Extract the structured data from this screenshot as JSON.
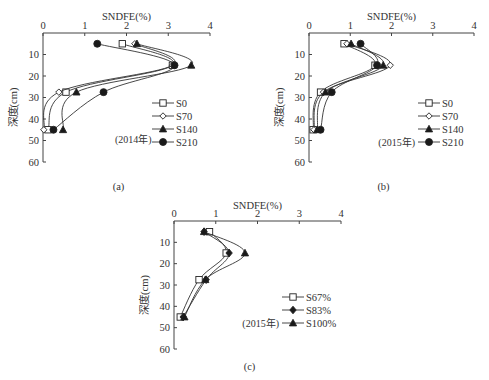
{
  "chart_data": [
    {
      "id": "a",
      "type": "line",
      "title": "",
      "panel_label": "(a)",
      "annotation": "(2014年)",
      "xlabel": "SNDFE(%)",
      "ylabel": "深度(cm)",
      "xlim": [
        0,
        4
      ],
      "ylim": [
        0,
        60
      ],
      "x_ticks": [
        "0",
        "1",
        "2",
        "3",
        "4"
      ],
      "y_ticks": [
        "10",
        "20",
        "30",
        "40",
        "50",
        "60"
      ],
      "x_axis_position": "top",
      "y_inverted": true,
      "grid": false,
      "legend_position": "lower right",
      "depths": [
        5,
        15,
        27.5,
        45
      ],
      "series": [
        {
          "name": "S0",
          "marker": "square-open",
          "values": [
            1.9,
            3.1,
            0.55,
            0.12
          ]
        },
        {
          "name": "S70",
          "marker": "diamond-open",
          "values": [
            2.2,
            3.1,
            0.38,
            0.02
          ]
        },
        {
          "name": "S140",
          "marker": "triangle-filled",
          "values": [
            2.25,
            3.55,
            0.8,
            0.48
          ]
        },
        {
          "name": "S210",
          "marker": "circle-filled",
          "values": [
            1.3,
            3.15,
            1.45,
            0.25
          ]
        }
      ]
    },
    {
      "id": "b",
      "type": "line",
      "title": "",
      "panel_label": "(b)",
      "annotation": "(2015年)",
      "xlabel": "SNDFE(%)",
      "ylabel": "深度(cm)",
      "xlim": [
        0,
        4
      ],
      "ylim": [
        0,
        60
      ],
      "x_ticks": [
        "0",
        "1",
        "2",
        "3",
        "4"
      ],
      "y_ticks": [
        "10",
        "20",
        "30",
        "40",
        "50",
        "60"
      ],
      "x_axis_position": "top",
      "y_inverted": true,
      "grid": false,
      "legend_position": "lower right",
      "depths": [
        5,
        15,
        27.5,
        45
      ],
      "series": [
        {
          "name": "S0",
          "marker": "square-open",
          "values": [
            0.85,
            1.6,
            0.28,
            0.1
          ]
        },
        {
          "name": "S70",
          "marker": "diamond-open",
          "values": [
            0.92,
            1.97,
            0.35,
            0.12
          ]
        },
        {
          "name": "S140",
          "marker": "triangle-filled",
          "values": [
            1.02,
            1.8,
            0.4,
            0.2
          ]
        },
        {
          "name": "S210",
          "marker": "circle-filled",
          "values": [
            1.25,
            1.65,
            0.55,
            0.28
          ]
        }
      ]
    },
    {
      "id": "c",
      "type": "line",
      "title": "",
      "panel_label": "(c)",
      "annotation": "(2015年)",
      "xlabel": "SNDFE(%)",
      "ylabel": "深度(cm)",
      "xlim": [
        0,
        4
      ],
      "ylim": [
        0,
        60
      ],
      "x_ticks": [
        "0",
        "1",
        "2",
        "3",
        "4"
      ],
      "y_ticks": [
        "10",
        "20",
        "30",
        "40",
        "50",
        "60"
      ],
      "x_axis_position": "top",
      "y_inverted": true,
      "grid": false,
      "legend_position": "lower right",
      "depths": [
        5,
        15,
        27.5,
        45
      ],
      "series": [
        {
          "name": "S67%",
          "marker": "square-open",
          "values": [
            0.85,
            1.25,
            0.6,
            0.15
          ]
        },
        {
          "name": "S83%",
          "marker": "diamond-filled",
          "values": [
            0.72,
            1.32,
            0.77,
            0.22
          ]
        },
        {
          "name": "S100%",
          "marker": "triangle-filled",
          "values": [
            0.72,
            1.7,
            0.75,
            0.25
          ]
        }
      ]
    }
  ],
  "layout": {
    "panels": {
      "a": {
        "x0": 43,
        "x1": 210,
        "y0": 33,
        "y1": 162,
        "title_y": 14,
        "legend_x": 166,
        "legend_y": 103,
        "legend_dy": 13,
        "annot_x": 115,
        "annot_y": 143,
        "annot_inline": false,
        "label_y": 190
      },
      "b": {
        "x0": 309,
        "x1": 474,
        "y0": 33,
        "y1": 162,
        "title_y": 14,
        "legend_x": 432,
        "legend_y": 103,
        "legend_dy": 13,
        "annot_x": 371,
        "annot_y": 155,
        "annot_inline": true,
        "label_y": 190
      },
      "c": {
        "x0": 174,
        "x1": 341,
        "y0": 221,
        "y1": 349,
        "title_y": 203,
        "legend_x": 296,
        "legend_y": 297,
        "legend_dy": 13,
        "annot_x": 249,
        "annot_y": 326,
        "annot_inline": true,
        "label_y": 370
      }
    },
    "colors": {
      "axis": "#444444",
      "line": "#333333",
      "marker_fill": "#1a1a1a",
      "marker_open": "#ffffff",
      "text": "#333333"
    }
  }
}
